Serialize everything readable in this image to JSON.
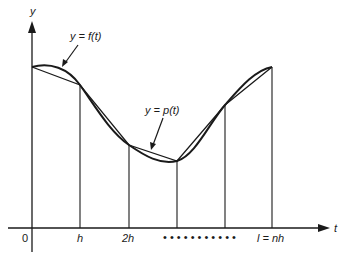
{
  "diagram": {
    "axes": {
      "y_label": "y",
      "x_label": "t",
      "origin_label": "0"
    },
    "ticks": [
      {
        "label": "h"
      },
      {
        "label": "2h"
      },
      {
        "label": "l = nh"
      }
    ],
    "ellipsis": "• • • • • • • • • • •",
    "curves": [
      {
        "label": "y = f(t)",
        "kind": "smooth-curve"
      },
      {
        "label": "y = p(t)",
        "kind": "polyline"
      }
    ],
    "nodes": [
      {
        "x": 32,
        "y": 67
      },
      {
        "x": 80,
        "y": 85
      },
      {
        "x": 129,
        "y": 145
      },
      {
        "x": 177,
        "y": 161
      },
      {
        "x": 225,
        "y": 105
      },
      {
        "x": 272,
        "y": 67
      }
    ],
    "colors": {
      "ink": "#1a1a1a",
      "background": "#ffffff"
    }
  }
}
